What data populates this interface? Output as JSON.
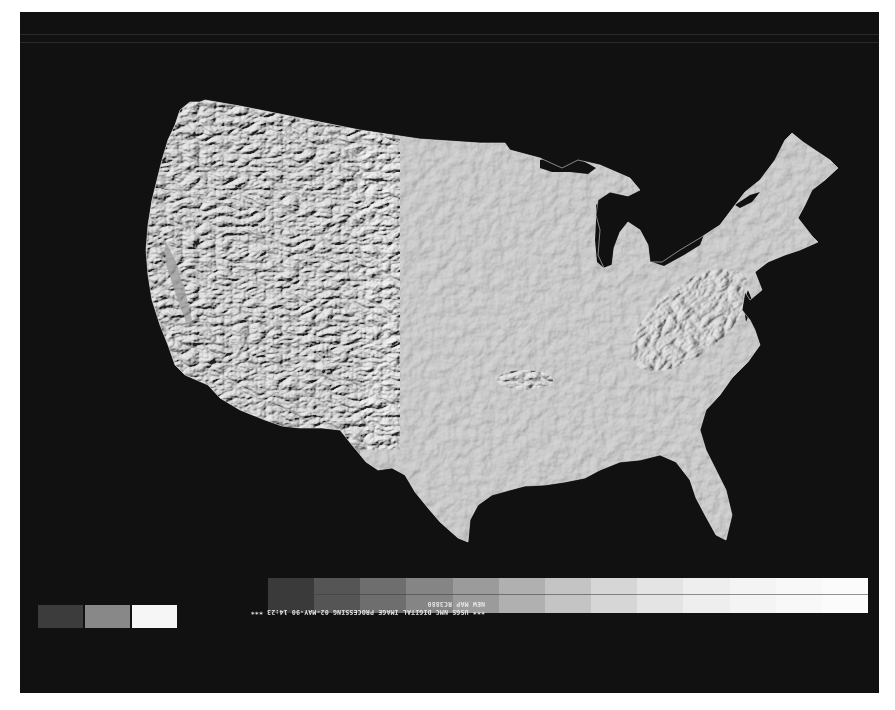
{
  "map": {
    "title": "Shaded relief map of the conterminous United States",
    "region": "Contiguous United States",
    "style": "grayscale shaded relief",
    "colors": {
      "background": "#111111",
      "land": "#a2a2a2",
      "border": "#ffffff"
    }
  },
  "caption": {
    "rotated_180": true,
    "line1": "*** USGS NMC DIGITAL IMAGE PROCESSING 02-MAY-90 14:23 ***",
    "line2": "NEW MAP   RC3880"
  },
  "gray_scale": {
    "steps": [
      "#3a3a3a",
      "#555555",
      "#6e6e6e",
      "#858585",
      "#9b9b9b",
      "#b0b0b0",
      "#c4c4c4",
      "#d6d6d6",
      "#e4e4e4",
      "#eeeeee",
      "#f4f4f4",
      "#f8f8f8",
      "#fbfbfb"
    ]
  },
  "reference_squares": {
    "colors": [
      "#3c3c3c",
      "#888888",
      "#f6f6f6"
    ]
  }
}
